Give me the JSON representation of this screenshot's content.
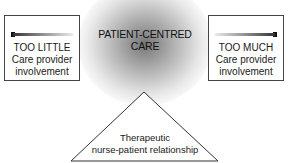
{
  "diagram": {
    "center": {
      "line1": "PATIENT-CENTRED",
      "line2": "CARE"
    },
    "left_box": {
      "title": "TOO LITTLE",
      "line2": "Care provider",
      "line3": "involvement",
      "indicator": "gradient-bar-left-marker"
    },
    "right_box": {
      "title": "TOO MUCH",
      "line2": "Care provider",
      "line3": "involvement",
      "indicator": "gradient-bar-right-marker"
    },
    "triangle": {
      "line1": "Therapeutic",
      "line2": "nurse-patient relationship"
    }
  },
  "colors": {
    "glow": "#6e6e6e",
    "border": "#444444",
    "text": "#1a1a1a",
    "background": "#ffffff"
  }
}
